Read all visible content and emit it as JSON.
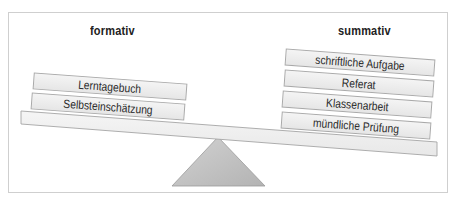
{
  "diagram": {
    "type": "balance-scale",
    "left_side": {
      "heading": "formativ",
      "items": [
        "Lerntagebuch",
        "Selbsteinschätzung"
      ]
    },
    "right_side": {
      "heading": "summativ",
      "items": [
        "schriftliche Aufgabe",
        "Referat",
        "Klassenarbeit",
        "mündliche Prüfung"
      ]
    },
    "tilt": "right side lower",
    "colors": {
      "frame_border": "#cfcfcf",
      "box_fill": "#ececec",
      "box_border": "#a9a9a9",
      "fulcrum_fill": "#c4c4c4",
      "text": "#222222"
    }
  }
}
